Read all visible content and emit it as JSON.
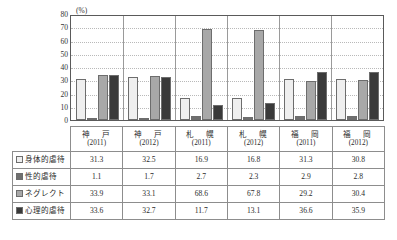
{
  "chart_data": {
    "type": "bar",
    "title": "",
    "subtitle": "",
    "xlabel": "",
    "ylabel": "",
    "unit_label": "(%)",
    "ylim": [
      0,
      80
    ],
    "ytick_step": 10,
    "yticks": [
      80,
      70,
      60,
      50,
      40,
      30,
      20,
      10,
      0
    ],
    "grid": true,
    "legend_position": "table-first-column",
    "categories": [
      {
        "name": "神　戸",
        "year": "(2011)"
      },
      {
        "name": "神　戸",
        "year": "(2012)"
      },
      {
        "name": "札　幌",
        "year": "(2011)"
      },
      {
        "name": "札　幌",
        "year": "(2012)"
      },
      {
        "name": "福　岡",
        "year": "(2011)"
      },
      {
        "name": "福　岡",
        "year": "(2012)"
      }
    ],
    "series": [
      {
        "name": "身体的虐待",
        "color": "#efefef",
        "values": [
          31.3,
          32.5,
          16.9,
          16.8,
          31.3,
          30.8
        ]
      },
      {
        "name": "性的虐待",
        "color": "#6f6f6f",
        "values": [
          1.1,
          1.7,
          2.7,
          2.3,
          2.9,
          2.8
        ]
      },
      {
        "name": "ネグレクト",
        "color": "#a8a8a8",
        "values": [
          33.9,
          33.1,
          68.6,
          67.8,
          29.2,
          30.4
        ]
      },
      {
        "name": "心理的虐待",
        "color": "#3a3a3a",
        "values": [
          33.6,
          32.7,
          11.7,
          13.1,
          36.6,
          35.9
        ]
      }
    ]
  },
  "table": {
    "corner_label": "",
    "column_headers": [
      {
        "name": "神　戸",
        "year": "(2011)"
      },
      {
        "name": "神　戸",
        "year": "(2012)"
      },
      {
        "name": "札　幌",
        "year": "(2011)"
      },
      {
        "name": "札　幌",
        "year": "(2012)"
      },
      {
        "name": "福　岡",
        "year": "(2011)"
      },
      {
        "name": "福　岡",
        "year": "(2012)"
      }
    ],
    "rows": [
      {
        "label": "身体的虐待",
        "swatch": "s0",
        "values": [
          "31.3",
          "32.5",
          "16.9",
          "16.8",
          "31.3",
          "30.8"
        ]
      },
      {
        "label": "性的虐待",
        "swatch": "s1",
        "values": [
          "1.1",
          "1.7",
          "2.7",
          "2.3",
          "2.9",
          "2.8"
        ]
      },
      {
        "label": "ネグレクト",
        "swatch": "s2",
        "values": [
          "33.9",
          "33.1",
          "68.6",
          "67.8",
          "29.2",
          "30.4"
        ]
      },
      {
        "label": "心理的虐待",
        "swatch": "s3",
        "values": [
          "33.6",
          "32.7",
          "11.7",
          "13.1",
          "36.6",
          "35.9"
        ]
      }
    ]
  }
}
